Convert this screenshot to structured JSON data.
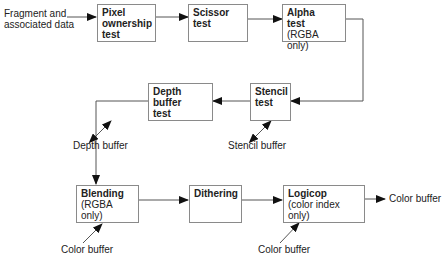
{
  "diagram": {
    "input_label_line1": "Fragment and",
    "input_label_line2": "associated data",
    "output_label": "Color buffer",
    "stages": [
      {
        "id": "pixel",
        "title_line1": "Pixel",
        "title_line2": "ownership",
        "title_line3": "test"
      },
      {
        "id": "scissor",
        "title_line1": "Scissor",
        "title_line2": "test"
      },
      {
        "id": "alpha",
        "title_line1": "Alpha",
        "title_line2": "test",
        "subtitle": "(RGBA only)"
      },
      {
        "id": "stencil",
        "title_line1": "Stencil",
        "title_line2": "test"
      },
      {
        "id": "depth",
        "title_line1": "Depth buffer",
        "title_line2": "test"
      },
      {
        "id": "blending",
        "title_line1": "Blending",
        "subtitle": "(RGBA only)"
      },
      {
        "id": "dithering",
        "title_line1": "Dithering"
      },
      {
        "id": "logicop",
        "title_line1": "Logicop",
        "subtitle": "(color index only)"
      }
    ],
    "buffers": {
      "depth": "Depth buffer",
      "stencil": "Stencil buffer",
      "blending_color": "Color buffer",
      "logicop_color": "Color buffer"
    },
    "colors": {
      "line": "#555555",
      "box_border": "#8a8a8a",
      "arrowhead": "#111111"
    }
  }
}
